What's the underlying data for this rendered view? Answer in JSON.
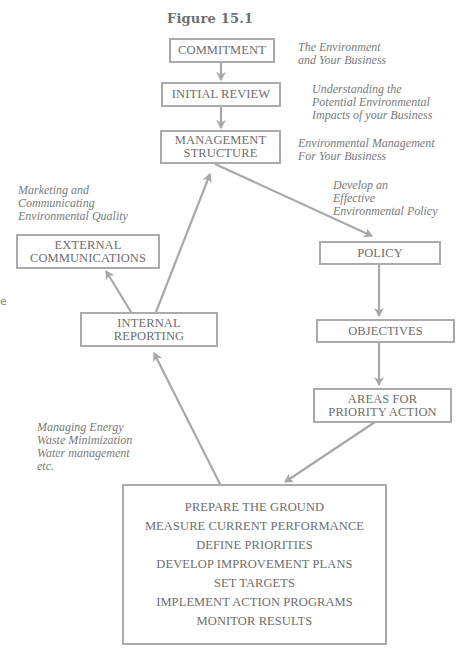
{
  "figure": {
    "title": "Figure 15.1"
  },
  "boxes": {
    "commitment": {
      "lines": [
        "COMMITMENT"
      ]
    },
    "initial_review": {
      "lines": [
        "INITIAL REVIEW"
      ]
    },
    "management_structure": {
      "lines": [
        "MANAGEMENT",
        "STRUCTURE"
      ]
    },
    "policy": {
      "lines": [
        "POLICY"
      ]
    },
    "objectives": {
      "lines": [
        "OBJECTIVES"
      ]
    },
    "areas_priority": {
      "lines": [
        "AREAS FOR",
        "PRIORITY ACTION"
      ]
    },
    "external_comms": {
      "lines": [
        "EXTERNAL",
        "COMMUNICATIONS"
      ]
    },
    "internal_reporting": {
      "lines": [
        "INTERNAL",
        "REPORTING"
      ]
    },
    "action_steps": {
      "lines": [
        "PREPARE THE GROUND",
        "MEASURE CURRENT PERFORMANCE",
        "DEFINE PRIORITIES",
        "DEVELOP IMPROVEMENT PLANS",
        "SET TARGETS",
        "IMPLEMENT ACTION PROGRAMS",
        "MONITOR RESULTS"
      ]
    }
  },
  "notes": {
    "commitment": [
      "The Environment",
      "and Your Business"
    ],
    "initial_review": [
      "Understanding the",
      "Potential Environmental",
      "Impacts of your Business"
    ],
    "management_structure": [
      "Environmental Management",
      "For Your Business"
    ],
    "policy": [
      "Develop an",
      "Effective",
      "Environmental Policy"
    ],
    "external_comms": [
      "Marketing and",
      "Communicating",
      "Environmental Quality"
    ],
    "action_steps": [
      "Managing Energy",
      "Waste Minimization",
      "Water management",
      "etc."
    ]
  },
  "edge_fragment": "e",
  "colors": {
    "border": "#ababab",
    "arrow": "#a8a8a8",
    "text": "#6e6e6e",
    "note_text": "#7a7a7a"
  }
}
